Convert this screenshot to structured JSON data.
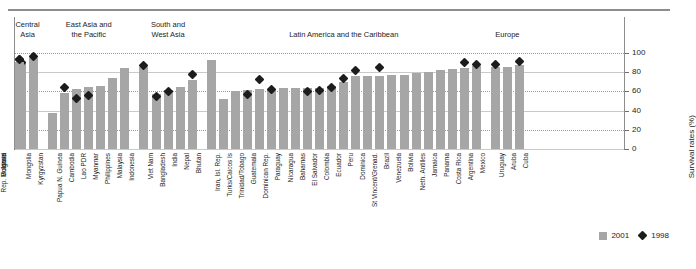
{
  "chart_data": {
    "type": "bar",
    "title": "",
    "xlabel": "",
    "ylabel": "Survival rates (%)",
    "ylim": [
      0,
      100
    ],
    "yticks": [
      0,
      20,
      40,
      60,
      80,
      100
    ],
    "grid": true,
    "legend_position": "bottom-right",
    "legend": [
      {
        "name": "2001",
        "marker": "bar",
        "color": "#a6a6a6"
      },
      {
        "name": "1998",
        "marker": "diamond",
        "color": "#1c1c1c"
      }
    ],
    "groups": [
      {
        "label": "Central\nAsia",
        "count": 2
      },
      {
        "label": "East Asia and\nthe Pacific",
        "count": 7
      },
      {
        "label": "South and\nWest Asia",
        "count": 5
      },
      {
        "label": "Latin America and the Caribbean",
        "count": 23
      },
      {
        "label": "Europe",
        "count": 3
      }
    ],
    "categories": [
      "Mongolia",
      "Kyrgyzstan",
      "Papua N. Guinea",
      "Cambodia",
      "Lao PDR",
      "Myanmar",
      "Philippines",
      "Malaysia",
      "Indonesia",
      "Viet Nam",
      "Bangladesh",
      "India",
      "Nepal",
      "Bhutan",
      "Iran, Isl. Rep.",
      "Turks/Caicos Is",
      "Trinidad/Tobago",
      "Guatemala",
      "Dominican Rep.",
      "Paraguay",
      "Nicaragua",
      "Bahamas",
      "El Salvador",
      "Colombia",
      "Ecuador",
      "Peru",
      "Dominica",
      "St Vincent/Grenad.",
      "Brazil",
      "Venezuela",
      "Bolivia",
      "Neth. Antilles",
      "Jamaica",
      "Panama",
      "Costa Rica",
      "Argentina",
      "Mexico",
      "Uruguay",
      "Aruba",
      "Cuba",
      "Israel",
      "Rep. Moldova",
      "Bulgaria"
    ],
    "series": [
      {
        "name": "2001",
        "values": [
          91,
          95,
          38,
          58,
          62,
          65,
          66,
          74,
          84,
          85,
          57,
          61,
          65,
          72,
          93,
          52,
          60,
          61,
          63,
          63,
          64,
          64,
          64,
          64,
          66,
          70,
          76,
          76,
          76,
          77,
          77,
          79,
          80,
          82,
          83,
          84,
          86,
          85,
          85,
          88,
          81,
          90,
          91
        ]
      },
      {
        "name": "1998",
        "values": [
          90,
          96,
          null,
          64,
          53,
          56,
          null,
          null,
          null,
          87,
          55,
          60,
          null,
          78,
          null,
          null,
          null,
          57,
          72,
          62,
          null,
          null,
          60,
          61,
          64,
          73,
          82,
          null,
          85,
          null,
          null,
          null,
          null,
          null,
          null,
          90,
          88,
          88,
          null,
          91,
          null,
          93,
          93
        ]
      }
    ]
  }
}
